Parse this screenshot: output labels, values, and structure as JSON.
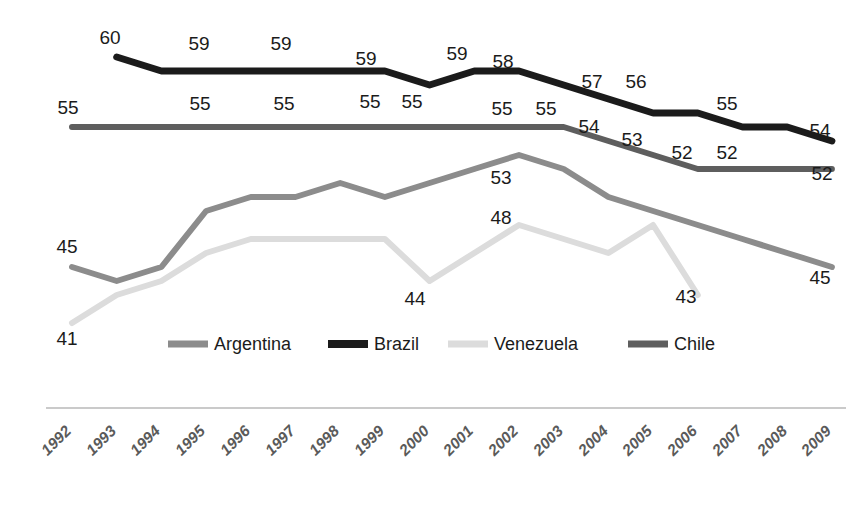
{
  "chart_data": {
    "type": "line",
    "title": "",
    "subtitle": "",
    "xlabel": "",
    "ylabel": "",
    "grid": false,
    "legend_position": "bottom-center",
    "axis": {
      "x_axis_visible": true,
      "y_axis_visible": false
    },
    "ylim": [
      38,
      62
    ],
    "categories": [
      "1992",
      "1993",
      "1994",
      "1995",
      "1996",
      "1997",
      "1998",
      "1999",
      "2000",
      "2001",
      "2002",
      "2003",
      "2004",
      "2005",
      "2006",
      "2007",
      "2008",
      "2009"
    ],
    "series": [
      {
        "name": "Argentina",
        "color": "#8c8c8c",
        "stroke_width": 6,
        "values": [
          45,
          44,
          45,
          49,
          50,
          50,
          51,
          50,
          51,
          52,
          53,
          52,
          50,
          49,
          48,
          47,
          46,
          45
        ],
        "labels": {
          "1992": "45",
          "2002": "53",
          "2009": "45"
        }
      },
      {
        "name": "Brazil",
        "color": "#1b1b1b",
        "stroke_width": 7,
        "values": [
          null,
          60,
          59,
          59,
          59,
          59,
          59,
          59,
          58,
          59,
          59,
          58,
          57,
          56,
          56,
          55,
          55,
          54
        ],
        "labels": {
          "1993": "60",
          "1995": "59",
          "1997": "59",
          "1999": "59",
          "2001": "59",
          "2002": "58",
          "2004": "57",
          "2005": "56",
          "2007": "55",
          "2009": "54"
        }
      },
      {
        "name": "Venezuela",
        "color": "#dcdcdc",
        "stroke_width": 6,
        "values": [
          41,
          43,
          44,
          46,
          47,
          47,
          47,
          47,
          44,
          46,
          48,
          47,
          46,
          48,
          43,
          null,
          null,
          null
        ],
        "labels": {
          "1992": "41",
          "2000": "44",
          "2002": "48",
          "2006": "43"
        }
      },
      {
        "name": "Chile",
        "color": "#5e5e5e",
        "stroke_width": 6,
        "values": [
          55,
          55,
          55,
          55,
          55,
          55,
          55,
          55,
          55,
          55,
          55,
          55,
          54,
          53,
          52,
          52,
          52,
          52
        ],
        "labels": {
          "1992": "55",
          "1995": "55",
          "1997": "55",
          "1999": "55",
          "2000": "55",
          "2002": "55",
          "2003": "55",
          "2004": "54",
          "2005": "53",
          "2006": "52",
          "2007": "52",
          "2009": "52"
        }
      }
    ],
    "data_labels": [
      {
        "series": "Brazil",
        "year": "1993",
        "text": "60",
        "x": 110,
        "y": 44
      },
      {
        "series": "Brazil",
        "year": "1995",
        "text": "59",
        "x": 199,
        "y": 50
      },
      {
        "series": "Brazil",
        "year": "1997",
        "text": "59",
        "x": 281,
        "y": 50
      },
      {
        "series": "Brazil",
        "year": "1999",
        "text": "59",
        "x": 366,
        "y": 65
      },
      {
        "series": "Brazil",
        "year": "2001",
        "text": "59",
        "x": 457,
        "y": 60
      },
      {
        "series": "Brazil",
        "year": "2002",
        "text": "58",
        "x": 503,
        "y": 68
      },
      {
        "series": "Brazil",
        "year": "2004",
        "text": "57",
        "x": 592,
        "y": 88
      },
      {
        "series": "Brazil",
        "year": "2005",
        "text": "56",
        "x": 636,
        "y": 88
      },
      {
        "series": "Brazil",
        "year": "2007",
        "text": "55",
        "x": 727,
        "y": 110
      },
      {
        "series": "Brazil",
        "year": "2009",
        "text": "54",
        "x": 820,
        "y": 137
      },
      {
        "series": "Chile",
        "year": "1992",
        "text": "55",
        "x": 68,
        "y": 114
      },
      {
        "series": "Chile",
        "year": "1995",
        "text": "55",
        "x": 200,
        "y": 110
      },
      {
        "series": "Chile",
        "year": "1997",
        "text": "55",
        "x": 284,
        "y": 110
      },
      {
        "series": "Chile",
        "year": "1999",
        "text": "55",
        "x": 370,
        "y": 108
      },
      {
        "series": "Chile",
        "year": "2000",
        "text": "55",
        "x": 412,
        "y": 108
      },
      {
        "series": "Chile",
        "year": "2002",
        "text": "55",
        "x": 502,
        "y": 115
      },
      {
        "series": "Chile",
        "year": "2003",
        "text": "55",
        "x": 546,
        "y": 115
      },
      {
        "series": "Chile",
        "year": "2004",
        "text": "54",
        "x": 589,
        "y": 133
      },
      {
        "series": "Chile",
        "year": "2005",
        "text": "53",
        "x": 632,
        "y": 146
      },
      {
        "series": "Chile",
        "year": "2006",
        "text": "52",
        "x": 682,
        "y": 159
      },
      {
        "series": "Chile",
        "year": "2007",
        "text": "52",
        "x": 727,
        "y": 159
      },
      {
        "series": "Chile",
        "year": "2009",
        "text": "52",
        "x": 822,
        "y": 180
      },
      {
        "series": "Argentina",
        "year": "1992",
        "text": "45",
        "x": 67,
        "y": 253
      },
      {
        "series": "Argentina",
        "year": "2002",
        "text": "53",
        "x": 501,
        "y": 184
      },
      {
        "series": "Argentina",
        "year": "2009",
        "text": "45",
        "x": 820,
        "y": 284
      },
      {
        "series": "Venezuela",
        "year": "1992",
        "text": "41",
        "x": 67,
        "y": 345
      },
      {
        "series": "Venezuela",
        "year": "2000",
        "text": "44",
        "x": 415,
        "y": 305
      },
      {
        "series": "Venezuela",
        "year": "2002",
        "text": "48",
        "x": 501,
        "y": 224
      },
      {
        "series": "Venezuela",
        "year": "2006",
        "text": "43",
        "x": 686,
        "y": 303
      }
    ]
  },
  "legend": {
    "items": [
      {
        "label": "Argentina",
        "color": "#8c8c8c",
        "swatch_x": 168,
        "text_x": 214,
        "width": 40,
        "thickness": 7
      },
      {
        "label": "Brazil",
        "color": "#1b1b1b",
        "swatch_x": 328,
        "text_x": 374,
        "width": 40,
        "thickness": 8
      },
      {
        "label": "Venezuela",
        "color": "#dcdcdc",
        "swatch_x": 448,
        "text_x": 494,
        "width": 40,
        "thickness": 7
      },
      {
        "label": "Chile",
        "color": "#5e5e5e",
        "swatch_x": 628,
        "text_x": 674,
        "width": 40,
        "thickness": 7
      }
    ],
    "y": 344
  },
  "xaxis": {
    "line": {
      "x1": 46,
      "x2": 846,
      "y": 408,
      "color": "#b9b9b9"
    },
    "ticks": [
      {
        "label": "1992",
        "x": 72
      },
      {
        "label": "1993",
        "x": 117
      },
      {
        "label": "1994",
        "x": 161
      },
      {
        "label": "1995",
        "x": 206
      },
      {
        "label": "1996",
        "x": 251
      },
      {
        "label": "1997",
        "x": 296
      },
      {
        "label": "1998",
        "x": 340
      },
      {
        "label": "1999",
        "x": 385
      },
      {
        "label": "2000",
        "x": 430
      },
      {
        "label": "2001",
        "x": 474
      },
      {
        "label": "2002",
        "x": 519
      },
      {
        "label": "2003",
        "x": 564
      },
      {
        "label": "2004",
        "x": 609
      },
      {
        "label": "2005",
        "x": 653
      },
      {
        "label": "2006",
        "x": 698
      },
      {
        "label": "2007",
        "x": 743
      },
      {
        "label": "2008",
        "x": 788
      },
      {
        "label": "2009",
        "x": 832
      }
    ],
    "tick_label_y": 432,
    "rotation": -45
  },
  "geometry": {
    "x_start": 72,
    "x_step": 44.7,
    "y_for_value_55": 127,
    "px_per_unit": 14
  }
}
